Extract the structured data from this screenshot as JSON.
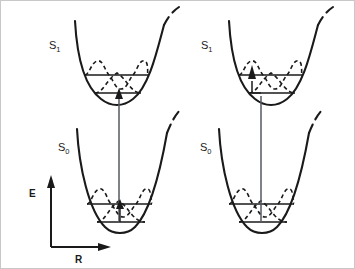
{
  "figure": {
    "type": "potential-energy-diagram",
    "background_color": "#ffffff",
    "line_color": "#1a1a1a",
    "panels": [
      {
        "id": "left",
        "states": [
          {
            "name": "S",
            "subscript": "1",
            "label_full": "S1",
            "role": "excited-state-well",
            "levels": [
              {
                "quantum_number": "v=1",
                "wavefunction": "double-hump"
              },
              {
                "quantum_number": "v=0",
                "wavefunction": "single-hump"
              }
            ]
          },
          {
            "name": "S",
            "subscript": "0",
            "label_full": "S0",
            "role": "ground-state-well",
            "levels": [
              {
                "quantum_number": "v=1",
                "wavefunction": "double-hump"
              },
              {
                "quantum_number": "v=0",
                "wavefunction": "single-hump"
              }
            ]
          }
        ],
        "transition": {
          "kind": "vertical-absorption-arrow",
          "alignment": "well-center"
        }
      },
      {
        "id": "right",
        "states": [
          {
            "name": "S",
            "subscript": "1",
            "label_full": "S1",
            "role": "excited-state-well",
            "levels": [
              {
                "quantum_number": "v=1",
                "wavefunction": "double-hump"
              },
              {
                "quantum_number": "v=0",
                "wavefunction": "single-hump"
              }
            ]
          },
          {
            "name": "S",
            "subscript": "0",
            "label_full": "S0",
            "role": "ground-state-well",
            "levels": [
              {
                "quantum_number": "v=1",
                "wavefunction": "double-hump"
              },
              {
                "quantum_number": "v=0",
                "wavefunction": "single-hump"
              }
            ]
          }
        ],
        "transition": {
          "kind": "vertical-absorption-arrow",
          "alignment": "offset-left-of-center"
        }
      }
    ]
  },
  "axes": {
    "y_label": "E",
    "x_label": "R"
  },
  "labels": {
    "left_upper_state": "S",
    "left_upper_state_sub": "1",
    "left_lower_state": "S",
    "left_lower_state_sub": "0",
    "right_upper_state": "S",
    "right_upper_state_sub": "1",
    "right_lower_state": "S",
    "right_lower_state_sub": "0"
  }
}
